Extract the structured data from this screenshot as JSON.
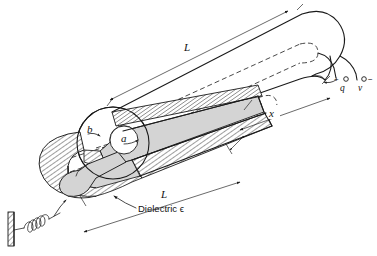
{
  "figure": {
    "domain_note": "engineering-physics line diagram",
    "background_color": "#ffffff",
    "line_color": "#1a1a1a",
    "dielectric_fill_color": "#d4d4d4"
  },
  "labels": {
    "length_top": "L",
    "length_bottom": "L",
    "displacement": "x",
    "radius_outer": "b",
    "radius_inner": "a",
    "charge": "q",
    "charge_sign": "+",
    "voltage": "v",
    "voltage_sign": "−",
    "dielectric": "Dielectric ϵ"
  },
  "annotations": [
    {
      "name": "top-length-dimension",
      "text": "L",
      "meaning": "total length of outer conductor"
    },
    {
      "name": "bottom-length-dimension",
      "text": "L",
      "meaning": "total length of dielectric sleeve"
    },
    {
      "name": "x-dimension",
      "text": "x",
      "meaning": "insertion distance of dielectric"
    },
    {
      "name": "outer-radius-callout",
      "text": "b",
      "meaning": "outer conductor radius"
    },
    {
      "name": "inner-radius-callout",
      "text": "a",
      "meaning": "inner conductor radius"
    },
    {
      "name": "dielectric-callout",
      "text": "Dielectric ϵ",
      "meaning": "permittivity of slab"
    },
    {
      "name": "positive-terminal",
      "text": "+q",
      "meaning": "charge on inner conductor"
    },
    {
      "name": "negative-terminal",
      "text": "v−",
      "meaning": "terminal voltage"
    }
  ],
  "components": {
    "wall": "fixed-hatched-wall",
    "spring": "coil-spring",
    "outer_conductor": "cylindrical-shell-cutaway",
    "inner_conductor": "solid-rod",
    "dielectric_sleeve": "gray-shaded-annulus"
  }
}
